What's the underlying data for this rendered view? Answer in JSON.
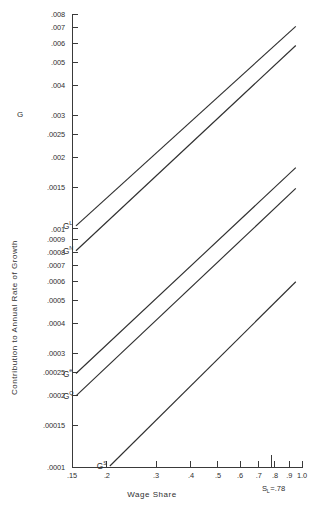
{
  "chart_data": {
    "type": "line",
    "title": "",
    "subtitle": "",
    "xlabel": "Wage  Share",
    "ylabel": "Contribution  to  Annual  Rate  of  Growth",
    "y_symbol": "G",
    "xscale": "log",
    "yscale": "log",
    "xlim": [
      0.14,
      1.04
    ],
    "ylim": [
      0.0001,
      0.008
    ],
    "grid": false,
    "legend": "inline-endpoint-labels",
    "xticks": [
      0.15,
      0.2,
      0.3,
      0.4,
      0.5,
      0.6,
      0.7,
      0.8,
      0.9,
      1.0
    ],
    "xticklabels": [
      ".15",
      ".2",
      ".3",
      ".4",
      ".5",
      ".6",
      ".7",
      ".8",
      ".9",
      "1.0"
    ],
    "yticks": [
      0.0001,
      0.00015,
      0.0002,
      0.00025,
      0.0003,
      0.0004,
      0.0005,
      0.0006,
      0.0007,
      0.0008,
      0.0009,
      0.001,
      0.0015,
      0.002,
      0.0025,
      0.003,
      0.004,
      0.005,
      0.006,
      0.007,
      0.008
    ],
    "yticklabels": [
      ".0001",
      ".00015",
      ".0002",
      ".00025",
      ".0003",
      ".0004",
      ".0005",
      ".0006",
      ".0007",
      ".0008",
      ".0009",
      ".001",
      ".0015",
      ".002",
      ".0025",
      ".003",
      ".004",
      ".005",
      ".006",
      ".007",
      ".008"
    ],
    "annotations": [
      {
        "name": "sl-marker",
        "text": "S",
        "sub": "L",
        "text2": "=.78",
        "x": 0.78,
        "label_y": 7.2e-05
      }
    ],
    "series": [
      {
        "name": "G-L",
        "label": "G",
        "superscript": "L",
        "x": [
          0.155,
          0.95
        ],
        "values": [
          0.00103,
          0.0071
        ]
      },
      {
        "name": "G-N",
        "label": "G",
        "superscript": "N",
        "x": [
          0.155,
          0.95
        ],
        "values": [
          0.00081,
          0.0059
        ]
      },
      {
        "name": "G-e",
        "label": "G",
        "superscript": "e",
        "x": [
          0.155,
          0.95
        ],
        "values": [
          0.000247,
          0.00181
        ]
      },
      {
        "name": "G-Q",
        "label": "G",
        "superscript": "Q",
        "x": [
          0.155,
          0.95
        ],
        "values": [
          0.000199,
          0.00148
        ]
      },
      {
        "name": "G-S",
        "label": "G",
        "superscript": "S",
        "x": [
          0.205,
          0.95
        ],
        "values": [
          0.000101,
          0.0006
        ]
      }
    ]
  }
}
